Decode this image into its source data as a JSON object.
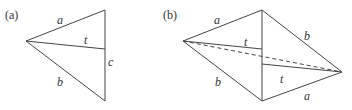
{
  "figure_a": {
    "tag": "(a)",
    "labels": {
      "a": "a",
      "t": "t",
      "c": "c",
      "b": "b"
    }
  },
  "figure_b": {
    "tag": "(b)",
    "labels": {
      "a_top": "a",
      "b_top": "b",
      "t_top": "t",
      "b_bottom": "b",
      "t_bottom": "t",
      "a_bottom": "a"
    }
  },
  "colors": {
    "line": "#444444",
    "text": "#333333",
    "background": "#ffffff"
  }
}
